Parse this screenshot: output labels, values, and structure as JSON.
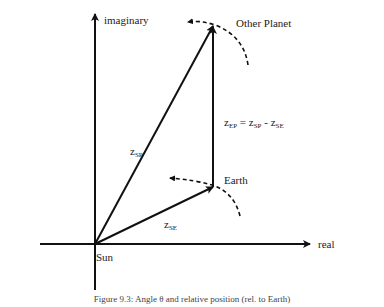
{
  "diagram": {
    "axes": {
      "x_label": "real",
      "y_label": "imaginary"
    },
    "points": {
      "sun": "Sun",
      "earth": "Earth",
      "other_planet": "Other Planet"
    },
    "vectors": {
      "sun_to_planet": {
        "base": "z",
        "sub": "SP"
      },
      "sun_to_earth": {
        "base": "z",
        "sub": "SE"
      },
      "earth_to_planet": {
        "base": "z",
        "sub": "EP",
        "eq": " = ",
        "t1_base": "z",
        "t1_sub": "SP",
        "minus": " - ",
        "t2_base": "z",
        "t2_sub": "SE"
      }
    },
    "caption": "Figure 9.3: Angle θ and relative position (rel. to Earth)"
  }
}
